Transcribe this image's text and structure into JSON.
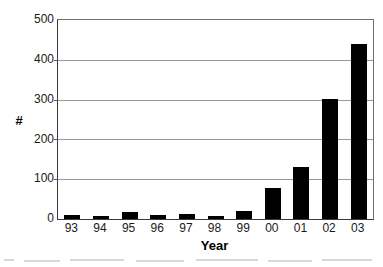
{
  "chart_data": {
    "type": "bar",
    "title": "",
    "subtitle": "",
    "xlabel": "Year",
    "ylabel": "#",
    "categories": [
      "93",
      "94",
      "95",
      "96",
      "97",
      "98",
      "99",
      "00",
      "01",
      "02",
      "03"
    ],
    "values": [
      10,
      7,
      17,
      10,
      13,
      7,
      20,
      79,
      131,
      302,
      440
    ],
    "series": [
      {
        "name": "Count",
        "values": [
          10,
          7,
          17,
          10,
          13,
          7,
          20,
          79,
          131,
          302,
          440
        ],
        "color": "#000000"
      }
    ],
    "ylim": [
      0,
      500
    ],
    "yticks": [
      0,
      100,
      200,
      300,
      400,
      500
    ],
    "ytick_labels": [
      "0",
      "100",
      "200",
      "300",
      "400",
      "500"
    ],
    "grid": true,
    "grid_axis": "y",
    "grid_color": "#9a9a9a",
    "legend": false,
    "legend_position": "none",
    "annotations": [],
    "bar_color": "#000000",
    "background_color": "#ffffff",
    "axis_color": "#3a3a3a"
  }
}
